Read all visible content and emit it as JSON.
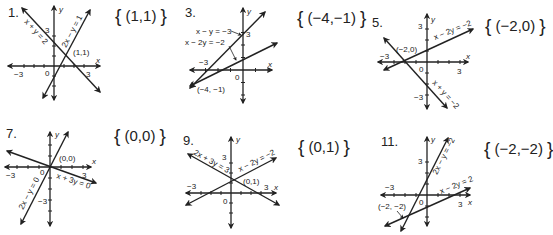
{
  "problems": [
    {
      "number": "1.",
      "answer": "(1,1)",
      "equations": [
        "x + y = 2",
        "2x − y = 1"
      ],
      "intersection_label": "(1,1)",
      "tick_labels": {
        "x_neg": "−3",
        "x_pos": "3",
        "y_pos": "3",
        "origin": "0"
      },
      "axis_labels": {
        "x": "x",
        "y": "y"
      }
    },
    {
      "number": "3.",
      "answer": "(−4,−1)",
      "equations": [
        "x − y = −3",
        "x − 2y = −2"
      ],
      "intersection_label": "(−4, −1)",
      "tick_labels": {
        "x_neg": "−3",
        "y_pos": "3",
        "origin": "0"
      },
      "axis_labels": {
        "x": "x",
        "y": "y"
      }
    },
    {
      "number": "5.",
      "answer": "(−2,0)",
      "equations": [
        "x − 2y = −2",
        "x + y = −2"
      ],
      "intersection_label": "(−2,0)",
      "tick_labels": {
        "x_neg": "−3",
        "x_pos": "3",
        "y_pos": "3",
        "y_neg": "−3",
        "origin": "0"
      },
      "axis_labels": {
        "x": "x",
        "y": "y"
      }
    },
    {
      "number": "7.",
      "answer": "(0,0)",
      "equations": [
        "2x − y = 0",
        "x + 3y = 0"
      ],
      "intersection_label": "(0,0)",
      "tick_labels": {
        "x_neg": "−3",
        "x_pos": "3",
        "y_neg": "−3",
        "origin": "0"
      },
      "axis_labels": {
        "x": "x",
        "y": "y"
      }
    },
    {
      "number": "9.",
      "answer": "(0,1)",
      "equations": [
        "2x + 3y = 3",
        "x − 2y = −2"
      ],
      "intersection_label": "(0,1)",
      "tick_labels": {
        "x_neg": "−3",
        "x_pos": "3",
        "y_pos": "3",
        "origin": "0"
      },
      "axis_labels": {
        "x": "x",
        "y": "y"
      }
    },
    {
      "number": "11.",
      "answer": "(−2,−2)",
      "equations": [
        "2x − y = −2",
        "x − 2y = 2"
      ],
      "intersection_label": "(−2, −2)",
      "tick_labels": {
        "x_neg": "−3",
        "x_pos": "3",
        "y_pos": "3",
        "origin": "0"
      },
      "axis_labels": {
        "x": "x",
        "y": "y"
      }
    }
  ],
  "brackets": {
    "open": "{",
    "close": "}"
  },
  "colors": {
    "ink": "#222222",
    "background": "#ffffff"
  }
}
